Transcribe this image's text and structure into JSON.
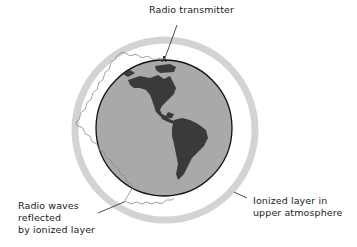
{
  "diagram": {
    "type": "scientific-illustration",
    "colors": {
      "globe_ocean": "#a9a9a9",
      "land": "#3a3a3a",
      "ionized_layer": "#d3d3d3",
      "outline": "#111111",
      "wave_line": "#888888",
      "text": "#222222"
    },
    "labels": {
      "transmitter": "Radio transmitter",
      "waves_line1": "Radio waves",
      "waves_line2": "reflected",
      "waves_line3": "by ionized layer",
      "layer_line1": "Ionized layer in",
      "layer_line2": "upper atmosphere"
    },
    "elements": [
      "globe",
      "ionized-layer-ring",
      "radio-wave-path",
      "transmitter"
    ]
  }
}
